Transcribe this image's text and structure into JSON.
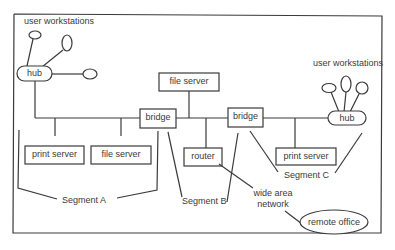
{
  "diagram": {
    "type": "network-topology",
    "nodes": {
      "ws_label_left": "user workstations",
      "ws_label_right": "user workstations",
      "hub_left": "hub",
      "hub_right": "hub",
      "file_server_top": "file server",
      "bridge_left": "bridge",
      "bridge_right": "bridge",
      "print_server_a": "print server",
      "file_server_a": "file server",
      "router": "router",
      "print_server_c": "print server",
      "wan": "wide area network",
      "wan_line1": "wide area",
      "wan_line2": "network",
      "remote_office": "remote office"
    },
    "segments": {
      "a": "Segment A",
      "b": "Segment B",
      "c": "Segment C"
    },
    "colors": {
      "stroke": "#3a3a3a",
      "background": "#ffffff"
    }
  }
}
